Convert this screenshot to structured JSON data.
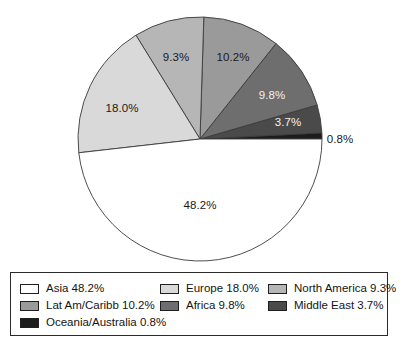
{
  "chart_data": {
    "type": "pie",
    "title": "",
    "subtitle": "",
    "xlabel": "",
    "ylabel": "",
    "legend_position": "bottom",
    "grid": false,
    "units": "percent",
    "start_angle_deg": 0,
    "direction": "counterclockwise",
    "center": {
      "x": 200,
      "y": 139,
      "radius": 122
    },
    "categories": [
      "Asia",
      "Europe",
      "North America",
      "Lat Am/Caribb",
      "Africa",
      "Middle East",
      "Oceania/Australia"
    ],
    "values": [
      48.2,
      18.0,
      9.3,
      10.2,
      9.8,
      3.7,
      0.8
    ],
    "labels": [
      "48.2%",
      "18.0%",
      "9.3%",
      "10.2%",
      "9.8%",
      "3.7%",
      "0.8%"
    ],
    "colors": [
      "#ffffff",
      "#d9d9d9",
      "#b6b6b6",
      "#9a9a9a",
      "#6e6e6e",
      "#4a4a4a",
      "#1c1c1c"
    ],
    "slices": [
      {
        "name": "Oceania/Australia",
        "value": 0.8,
        "label": "0.8%",
        "color": "#1c1c1c",
        "label_color": "dark",
        "label_x": 340,
        "label_y": 139,
        "label_inside": false
      },
      {
        "name": "Middle East",
        "value": 3.7,
        "label": "3.7%",
        "color": "#4a4a4a",
        "label_color": "light",
        "label_x": 288,
        "label_y": 122,
        "label_inside": true
      },
      {
        "name": "Africa",
        "value": 9.8,
        "label": "9.8%",
        "color": "#6e6e6e",
        "label_color": "light",
        "label_x": 272,
        "label_y": 95,
        "label_inside": true
      },
      {
        "name": "Lat Am/Caribb",
        "value": 10.2,
        "label": "10.2%",
        "color": "#9a9a9a",
        "label_color": "dark",
        "label_x": 233,
        "label_y": 57,
        "label_inside": true
      },
      {
        "name": "North America",
        "value": 9.3,
        "label": "9.3%",
        "color": "#b6b6b6",
        "label_color": "dark",
        "label_x": 176,
        "label_y": 57,
        "label_inside": true
      },
      {
        "name": "Europe",
        "value": 18.0,
        "label": "18.0%",
        "color": "#d9d9d9",
        "label_color": "dark",
        "label_x": 122,
        "label_y": 108,
        "label_inside": true
      },
      {
        "name": "Asia",
        "value": 48.2,
        "label": "48.2%",
        "color": "#ffffff",
        "label_color": "dark",
        "label_x": 200,
        "label_y": 205,
        "label_inside": true
      }
    ]
  },
  "legend": {
    "rows": [
      [
        {
          "label": "Asia 48.2%",
          "color": "#ffffff",
          "swatch_name": "legend-swatch-asia"
        },
        {
          "label": "Europe 18.0%",
          "color": "#d9d9d9",
          "swatch_name": "legend-swatch-europe"
        },
        {
          "label": "North America 9.3%",
          "color": "#b6b6b6",
          "swatch_name": "legend-swatch-north-america"
        }
      ],
      [
        {
          "label": "Lat Am/Caribb 10.2%",
          "color": "#9a9a9a",
          "swatch_name": "legend-swatch-lat-am-caribb"
        },
        {
          "label": "Africa 9.8%",
          "color": "#6e6e6e",
          "swatch_name": "legend-swatch-africa"
        },
        {
          "label": "Middle East 3.7%",
          "color": "#4a4a4a",
          "swatch_name": "legend-swatch-middle-east"
        }
      ],
      [
        {
          "label": "Oceania/Australia 0.8%",
          "color": "#1c1c1c",
          "swatch_name": "legend-swatch-oceania-australia"
        }
      ]
    ]
  }
}
